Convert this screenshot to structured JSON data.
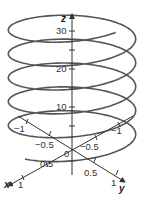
{
  "chart_data": {
    "type": "line",
    "subtype": "3d-parametric-curve",
    "title": "",
    "curve": {
      "description": "helix x = cos t, y = sin t, z = t",
      "t_range": [
        0,
        33
      ],
      "color": "#555555"
    },
    "axes": {
      "x": {
        "label": "x",
        "ticks": [
          -1,
          -0.5,
          0.5,
          1
        ],
        "tick_labels": [
          "-1",
          "-0.5",
          "0.5",
          "1"
        ],
        "range": [
          -1,
          1
        ]
      },
      "y": {
        "label": "y",
        "ticks": [
          -1,
          -0.5,
          0.5,
          1
        ],
        "tick_labels": [
          "-1",
          "-0.5",
          "0.5",
          "1"
        ],
        "range": [
          -1,
          1
        ]
      },
      "z": {
        "label": "z",
        "ticks": [
          5,
          10,
          15,
          20,
          25,
          30
        ],
        "tick_labels": [
          "10",
          "20",
          "30"
        ],
        "range": [
          0,
          34
        ]
      },
      "origin_label": "0"
    },
    "grid": false,
    "legend": null
  },
  "labels": {
    "x_axis": "x",
    "y_axis": "y",
    "z_axis": "z",
    "origin": "0",
    "z10": "10",
    "z20": "20",
    "z30": "30",
    "x_pos1": "1",
    "x_pos05": "0.5",
    "x_neg05": "−0.5",
    "x_neg1": "−1",
    "y_pos1": "1",
    "y_pos05": "0.5",
    "y_neg05": "−0.5",
    "y_neg1": "−1"
  }
}
